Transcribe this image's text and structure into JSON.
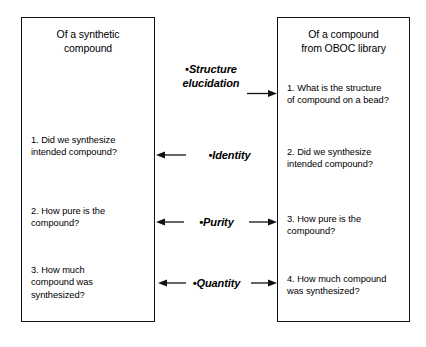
{
  "diagram": {
    "type": "comparison-flow",
    "left_panel": {
      "title_lines": [
        "Of a synthetic",
        "compound"
      ],
      "items": [
        {
          "id": "left-1",
          "lines": [
            "1. Did we synthesize",
            "intended compound?"
          ]
        },
        {
          "id": "left-2",
          "lines": [
            "2. How pure is the",
            "compound?"
          ]
        },
        {
          "id": "left-3",
          "lines": [
            "3. How much",
            "compound was",
            "synthesized?"
          ]
        }
      ]
    },
    "right_panel": {
      "title_lines": [
        "Of a compound",
        "from OBOC library"
      ],
      "items": [
        {
          "id": "right-1",
          "lines": [
            "1. What is the structure",
            "of compound on a bead?"
          ]
        },
        {
          "id": "right-2",
          "lines": [
            "2. Did we synthesize",
            "intended compound?"
          ]
        },
        {
          "id": "right-3",
          "lines": [
            "3. How pure is the",
            "compound?"
          ]
        },
        {
          "id": "right-4",
          "lines": [
            "4. How much compound",
            "was synthesized?"
          ]
        }
      ]
    },
    "center_labels": [
      {
        "id": "structure-elucidation",
        "bullet": "•",
        "lines": [
          "Structure",
          "elucidation"
        ],
        "arrow_left": false,
        "arrow_right": true
      },
      {
        "id": "identity",
        "bullet": "•",
        "lines": [
          "Identity"
        ],
        "arrow_left": true,
        "arrow_right": false
      },
      {
        "id": "purity",
        "bullet": "•",
        "lines": [
          "Purity"
        ],
        "arrow_left": true,
        "arrow_right": true
      },
      {
        "id": "quantity",
        "bullet": "•",
        "lines": [
          "Quantity"
        ],
        "arrow_left": true,
        "arrow_right": true
      }
    ],
    "colors": {
      "background": "#ffffff",
      "stroke": "#111111",
      "text": "#000000"
    }
  }
}
